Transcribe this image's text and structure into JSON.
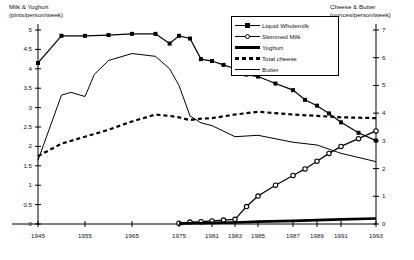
{
  "chart_data": {
    "type": "line",
    "title": "",
    "subtitle": "",
    "xlabel": "",
    "ylabel": "Milk & Yoghurt (pints/person/week)",
    "ylabel_right": "Cheese & Butter (ounces/person/week)",
    "left_axis": {
      "label_line1": "Milk & Yoghurt",
      "label_line2": "(pints/person/week)",
      "ylim": [
        0,
        5
      ],
      "tick_step": 0.5,
      "ticks": [
        "0",
        "0.5",
        "1",
        "1.5",
        "2",
        "2.5",
        "3",
        "3.5",
        "4",
        "4.5",
        "5"
      ]
    },
    "right_axis": {
      "label_line1": "Cheese & Butter",
      "label_line2": "(ounces/person/week)",
      "ylim": [
        0,
        7
      ],
      "tick_step": 1,
      "ticks": [
        "0",
        "1",
        "2",
        "3",
        "4",
        "5",
        "6",
        "7"
      ]
    },
    "x_axis": {
      "xlim": [
        1945,
        1993
      ],
      "ticks": [
        "1945",
        "1955",
        "1965",
        "1975",
        "1981",
        "1983",
        "1985",
        "1987",
        "1989",
        "1991",
        "1993"
      ],
      "tick_values": [
        1945,
        1955,
        1965,
        1975,
        1981,
        1983,
        1985,
        1987,
        1989,
        1991,
        1993
      ]
    },
    "grid": false,
    "legend_position": "top-right",
    "series": [
      {
        "name": "Liquid Wholemilk",
        "axis": "left",
        "marker": "filled-square",
        "line": "solid",
        "x": [
          1945,
          1950,
          1955,
          1960,
          1965,
          1970,
          1973,
          1975,
          1977,
          1979,
          1981,
          1982,
          1983,
          1984,
          1985,
          1986,
          1987,
          1988,
          1989,
          1990,
          1991,
          1992,
          1993
        ],
        "values": [
          4.15,
          4.85,
          4.85,
          4.87,
          4.9,
          4.9,
          4.65,
          4.85,
          4.78,
          4.25,
          4.2,
          4.1,
          4.0,
          3.85,
          3.8,
          3.62,
          3.45,
          3.2,
          3.05,
          2.85,
          2.62,
          2.35,
          2.15
        ]
      },
      {
        "name": "Skimmed Milk",
        "axis": "left",
        "marker": "open-circle",
        "line": "solid",
        "x": [
          1975,
          1977,
          1979,
          1981,
          1982,
          1983,
          1984,
          1985,
          1986,
          1987,
          1988,
          1989,
          1990,
          1991,
          1992,
          1993
        ],
        "values": [
          0.02,
          0.05,
          0.06,
          0.08,
          0.1,
          0.12,
          0.45,
          0.72,
          1.0,
          1.25,
          1.42,
          1.62,
          1.82,
          2.0,
          2.2,
          2.4
        ]
      },
      {
        "name": "Yoghurt",
        "axis": "left",
        "marker": "none",
        "line": "thick-solid",
        "x": [
          1975,
          1977,
          1979,
          1981,
          1983,
          1985,
          1987,
          1989,
          1991,
          1993
        ],
        "values": [
          0.01,
          0.02,
          0.02,
          0.03,
          0.04,
          0.06,
          0.08,
          0.1,
          0.12,
          0.14
        ]
      },
      {
        "name": "Total cheese",
        "axis": "right",
        "marker": "none",
        "line": "dashed",
        "x": [
          1945,
          1950,
          1955,
          1960,
          1965,
          1970,
          1973,
          1975,
          1977,
          1979,
          1981,
          1983,
          1985,
          1987,
          1989,
          1991,
          1993
        ],
        "values": [
          2.45,
          2.9,
          3.15,
          3.4,
          3.7,
          3.95,
          3.9,
          3.85,
          3.75,
          3.8,
          3.82,
          3.95,
          4.05,
          3.95,
          3.9,
          3.85,
          3.82
        ]
      },
      {
        "name": "Butter",
        "axis": "right",
        "marker": "none",
        "line": "solid",
        "x": [
          1945,
          1950,
          1952,
          1955,
          1957,
          1960,
          1965,
          1970,
          1973,
          1975,
          1977,
          1979,
          1981,
          1983,
          1985,
          1987,
          1989,
          1991,
          1993
        ],
        "values": [
          2.3,
          4.65,
          4.75,
          4.6,
          5.4,
          5.9,
          6.15,
          6.05,
          5.6,
          5.0,
          3.9,
          3.65,
          3.55,
          3.15,
          3.2,
          2.95,
          2.85,
          2.55,
          2.25
        ]
      }
    ],
    "annotations": []
  },
  "legend": {
    "items": [
      {
        "label": "Liquid Wholemilk",
        "style": "line-square"
      },
      {
        "label": "Skimmed Milk",
        "style": "line-circle"
      },
      {
        "label": "Yoghurt",
        "style": "thick-line"
      },
      {
        "label": "Total cheese",
        "style": "dashed-line"
      },
      {
        "label": "Butter",
        "style": "thin-line"
      }
    ]
  }
}
